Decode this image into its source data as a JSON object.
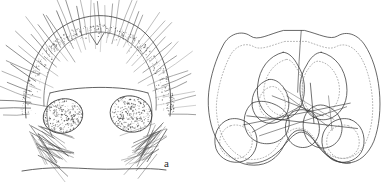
{
  "figure": {
    "kind": "scientific-line-drawing",
    "background_color": "#ffffff",
    "ink_color": "#3a3a3a",
    "stipple_color": "#555555",
    "panels": [
      {
        "id": "a",
        "label": "a",
        "label_x": 164,
        "label_y": 158,
        "description": "Anterior view of head capsule with densely setose arched frontal margin, two large stippled lateral eye areas and radiating marginal setae"
      },
      {
        "id": "b",
        "label": "b",
        "label_x": 269,
        "label_y": 152,
        "description": "Outline drawing of bilaterally symmetrical sclerite with paired dorsal lobes, paired ventro-lateral lobes and dotted inner contours with crossing linear elements"
      }
    ]
  },
  "panel_a_geometry": {
    "arch_outer": "M 26 118 C 22 82 36 44 62 27 C 86 12 112 12 136 26 C 162 42 174 80 170 116",
    "arch_inner": "M 44 106 C 42 78 54 50 74 39 C 92 29 110 30 126 40 C 148 54 158 82 156 110",
    "top_notch": "M 90 34 L 97 45 L 104 33",
    "clypeus_top": "M 50 93 C 76 86 122 85 148 93",
    "clypeus_left": "M 50 93 C 45 106 46 124 52 136",
    "clypeus_right": "M 148 93 C 154 106 153 124 147 136",
    "bottom_margin": "M 22 171 C 52 166 72 168 96 169 C 124 170 146 167 166 170",
    "eye_left": {
      "cx": 63,
      "cy": 116,
      "rx": 20,
      "ry": 17,
      "rot": -18
    },
    "eye_right": {
      "cx": 131,
      "cy": 114,
      "rx": 21,
      "ry": 18,
      "rot": 14
    },
    "seta_count_outer": 46,
    "seta_count_lower_left": 16,
    "seta_count_lower_right": 18,
    "stipple_points_arch": 430,
    "stipple_points_eye": 300
  },
  "panel_b_geometry": {
    "outline_solid": "M 96 24 C 80 28 68 36 60 30 C 50 23 36 28 30 40 C 22 55 16 74 14 92 C 12 112 16 132 24 146 C 32 160 44 170 58 172 C 74 174 86 168 94 156 C 100 146 104 136 112 134 C 120 132 126 138 132 148 C 140 160 152 170 166 170 C 180 170 190 160 196 146 C 202 130 204 110 202 90 C 200 70 194 52 186 40 C 178 28 166 24 156 30 C 148 35 136 28 120 24 Z",
    "outline_dotted": "M 98 36 C 84 40 72 46 64 42 C 54 36 42 42 37 53 C 30 67 25 84 23 100 C 21 117 25 134 32 146 C 39 157 49 165 60 166 C 73 167 83 161 90 151 C 96 142 101 134 110 132 C 119 130 126 136 132 145 C 139 156 149 165 162 165 C 174 165 183 157 188 145 C 194 131 196 113 194 95 C 192 77 187 61 180 51 C 173 41 163 37 154 42 C 146 46 135 40 122 36 Z",
    "midline": "M 116 24 C 114 46 113 70 112 92",
    "lobe_dorsal_left_solid": "M 96 48 C 80 52 70 66 68 84 C 66 100 72 114 84 120 C 96 126 110 120 116 106 C 122 92 120 74 112 62 C 108 54 102 48 96 48 Z",
    "lobe_dorsal_left_dotted": "M 99 56 C 86 60 77 72 75 87 C 73 100 79 111 89 116 C 99 121 110 115 115 103 C 120 90 118 76 111 66 C 107 59 103 55 99 56 Z",
    "lobe_dorsal_right_solid": "M 138 48 C 154 52 164 66 166 84 C 168 100 162 114 150 120 C 138 126 124 120 118 106 C 112 92 114 74 122 62 C 126 54 132 48 138 48 Z",
    "lobe_dorsal_right_dotted": "M 136 58 C 148 60 157 73 158 87 C 159 100 153 111 143 116 C 133 121 123 114 119 102 C 115 89 117 75 124 66 C 128 60 132 57 136 58 Z",
    "inner_left_curl_solid": "M 80 78 C 68 82 60 94 62 108 C 64 120 74 128 86 126 C 98 124 104 112 102 100 C 100 88 90 76 80 78 Z",
    "inner_left_curl_dotted": "M 82 86 C 73 89 68 98 70 108 C 72 117 79 122 88 120 C 96 118 100 110 98 101 C 96 92 89 84 82 86 Z",
    "mid_left_lobe_solid": "M 62 104 C 54 110 50 124 56 136 C 62 148 78 152 90 146 C 102 140 106 126 100 116 C 94 106 74 98 62 104 Z",
    "mid_right_lobe_solid": "M 124 112 C 116 120 116 136 124 146 C 132 156 148 156 156 146 C 164 136 162 120 152 112 C 142 104 132 104 124 112 Z",
    "mid_center_lobe": "M 106 114 C 98 120 96 134 102 144 C 108 154 122 156 130 148 C 138 140 138 124 130 116 C 124 110 112 110 106 114 Z",
    "ventral_lobe_left_solid": "M 36 122 C 24 126 18 140 22 154 C 26 166 40 172 52 168 C 64 164 70 150 66 138 C 62 126 48 118 36 122 Z",
    "ventral_lobe_right_solid": "M 170 122 C 182 126 188 140 184 154 C 180 166 166 172 154 168 C 142 164 136 150 140 138 C 144 126 158 118 170 122 Z",
    "ventral_lobe_left_dotted": "M 38 129 C 29 132 24 143 27 153 C 30 162 41 167 50 164 C 60 160 64 149 61 140 C 58 131 47 126 38 129 Z",
    "ventral_lobe_right_dotted": "M 168 129 C 177 132 182 143 179 153 C 176 162 165 167 156 164 C 146 160 142 149 145 140 C 148 131 159 126 168 129 Z",
    "bottom_margin": "M 56 170 C 72 172 86 164 96 152 C 104 142 110 136 116 136 C 122 136 128 142 136 152 C 146 164 158 172 170 170",
    "crossing_lines": [
      "M 52 128 L 170 104",
      "M 56 118 L 178 132",
      "M 70 140 L 166 108",
      "M 96 88 L 152 122",
      "M 118 106 L 62 136",
      "M 100 96 L 146 130",
      "M 84 96 L 140 118",
      "M 126 82 L 130 126",
      "M 146 96 L 150 134"
    ]
  }
}
